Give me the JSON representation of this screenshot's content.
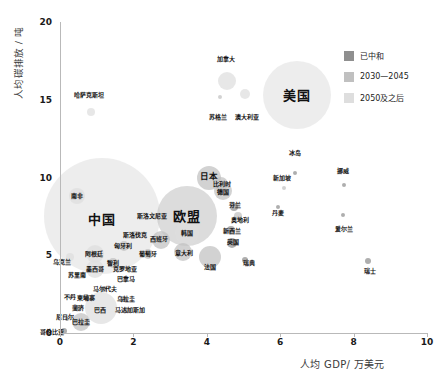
{
  "chart_data": {
    "type": "scatter",
    "title": "",
    "xlabel": "人均 GDP/ 万美元",
    "ylabel": "人均碳排放 / 吨",
    "xlim": [
      0,
      10
    ],
    "ylim": [
      0,
      20
    ],
    "xticks": [
      "0",
      "2",
      "4",
      "6",
      "8",
      "10"
    ],
    "yticks": [
      "0",
      "5",
      "10",
      "15",
      "20"
    ],
    "grid": false,
    "legend_position": "top-right",
    "legend": [
      {
        "label": "已中和",
        "color": "#8f8f8f"
      },
      {
        "label": "2030—2045",
        "color": "#c0c0c0"
      },
      {
        "label": "2050及之后",
        "color": "#dedede"
      }
    ],
    "points": [
      {
        "name": "美国",
        "x": 6.45,
        "y": 15.3,
        "r": 34,
        "group": 2,
        "label_size": "big",
        "lx": 6.45,
        "ly": 15.3
      },
      {
        "name": "加拿大",
        "x": 4.55,
        "y": 16.2,
        "r": 9,
        "group": 2,
        "label_size": "sm",
        "lx": 4.52,
        "ly": 17.6
      },
      {
        "name": "苏格兰",
        "x": 4.35,
        "y": 15.2,
        "r": 2,
        "group": 1,
        "label_size": "sm",
        "lx": 4.3,
        "ly": 13.9
      },
      {
        "name": "澳大利亚",
        "x": 5.05,
        "y": 15.4,
        "r": 5,
        "group": 2,
        "label_size": "sm",
        "lx": 5.1,
        "ly": 13.9
      },
      {
        "name": "哈萨克斯坦",
        "x": 0.85,
        "y": 14.2,
        "r": 4,
        "group": 2,
        "label_size": "sm",
        "lx": 0.8,
        "ly": 15.3
      },
      {
        "name": "中国",
        "x": 1.15,
        "y": 7.5,
        "r": 58,
        "group": 2,
        "label_size": "big",
        "lx": 1.15,
        "ly": 7.3
      },
      {
        "name": "南非",
        "x": 0.45,
        "y": 8.8,
        "r": 8,
        "group": 2,
        "label_size": "sm",
        "lx": 0.45,
        "ly": 8.8
      },
      {
        "name": "欧盟",
        "x": 3.45,
        "y": 7.5,
        "r": 30,
        "group": 1,
        "label_size": "big",
        "lx": 3.45,
        "ly": 7.5
      },
      {
        "name": "日本",
        "x": 4.05,
        "y": 10.0,
        "r": 12,
        "group": 1,
        "label_size": "mid",
        "lx": 4.05,
        "ly": 10.1
      },
      {
        "name": "比利时",
        "x": 4.4,
        "y": 9.6,
        "r": 7,
        "group": 1,
        "label_size": "sm",
        "lx": 4.42,
        "ly": 9.55
      },
      {
        "name": "德国",
        "x": 4.45,
        "y": 9.1,
        "r": 9,
        "group": 1,
        "label_size": "sm",
        "lx": 4.45,
        "ly": 9.05
      },
      {
        "name": "芬兰",
        "x": 4.75,
        "y": 8.1,
        "r": 4,
        "group": 0,
        "label_size": "sm",
        "lx": 4.78,
        "ly": 8.25
      },
      {
        "name": "奥地利",
        "x": 4.85,
        "y": 7.5,
        "r": 4,
        "group": 1,
        "label_size": "sm",
        "lx": 4.9,
        "ly": 7.25
      },
      {
        "name": "冰岛",
        "x": 6.4,
        "y": 10.3,
        "r": 2,
        "group": 0,
        "label_size": "sm",
        "lx": 6.4,
        "ly": 11.6
      },
      {
        "name": "新加坡",
        "x": 6.1,
        "y": 9.3,
        "r": 2,
        "group": 1,
        "label_size": "sm",
        "lx": 6.05,
        "ly": 10.0
      },
      {
        "name": "挪威",
        "x": 7.75,
        "y": 9.5,
        "r": 2,
        "group": 0,
        "label_size": "sm",
        "lx": 7.72,
        "ly": 10.4
      },
      {
        "name": "丹麦",
        "x": 5.95,
        "y": 8.1,
        "r": 2,
        "group": 0,
        "label_size": "sm",
        "lx": 5.95,
        "ly": 7.7
      },
      {
        "name": "爱尔兰",
        "x": 7.7,
        "y": 7.6,
        "r": 2,
        "group": 0,
        "label_size": "sm",
        "lx": 7.75,
        "ly": 6.7
      },
      {
        "name": "新西兰",
        "x": 4.65,
        "y": 6.6,
        "r": 4,
        "group": 0,
        "label_size": "sm",
        "lx": 4.68,
        "ly": 6.55
      },
      {
        "name": "英国",
        "x": 4.7,
        "y": 5.8,
        "r": 5,
        "group": 0,
        "label_size": "sm",
        "lx": 4.72,
        "ly": 5.85
      },
      {
        "name": "韩国",
        "x": 3.45,
        "y": 6.4,
        "r": 12,
        "group": 2,
        "label_size": "sm",
        "lx": 3.45,
        "ly": 6.4
      },
      {
        "name": "意大利",
        "x": 3.35,
        "y": 5.2,
        "r": 9,
        "group": 1,
        "label_size": "sm",
        "lx": 3.38,
        "ly": 5.15
      },
      {
        "name": "法国",
        "x": 4.1,
        "y": 4.9,
        "r": 11,
        "group": 1,
        "label_size": "sm",
        "lx": 4.1,
        "ly": 4.25
      },
      {
        "name": "瑞典",
        "x": 5.05,
        "y": 4.7,
        "r": 3,
        "group": 0,
        "label_size": "sm",
        "lx": 5.15,
        "ly": 4.5
      },
      {
        "name": "瑞士",
        "x": 8.4,
        "y": 4.6,
        "r": 3,
        "group": 0,
        "label_size": "sm",
        "lx": 8.45,
        "ly": 4.0
      },
      {
        "name": "斯洛文尼亚",
        "x": 2.55,
        "y": 7.5,
        "r": 3,
        "group": 1,
        "label_size": "sm",
        "lx": 2.5,
        "ly": 7.5
      },
      {
        "name": "斯洛伐克",
        "x": 2.05,
        "y": 6.3,
        "r": 4,
        "group": 1,
        "label_size": "sm",
        "lx": 2.05,
        "ly": 6.3
      },
      {
        "name": "西班牙",
        "x": 2.75,
        "y": 6.0,
        "r": 9,
        "group": 1,
        "label_size": "sm",
        "lx": 2.7,
        "ly": 6.05
      },
      {
        "name": "匈牙利",
        "x": 1.75,
        "y": 5.6,
        "r": 5,
        "group": 1,
        "label_size": "sm",
        "lx": 1.72,
        "ly": 5.6
      },
      {
        "name": "葡萄牙",
        "x": 2.4,
        "y": 5.1,
        "r": 5,
        "group": 1,
        "label_size": "sm",
        "lx": 2.4,
        "ly": 5.05
      },
      {
        "name": "阿根廷",
        "x": 0.95,
        "y": 5.1,
        "r": 9,
        "group": 2,
        "label_size": "sm",
        "lx": 0.93,
        "ly": 5.1
      },
      {
        "name": "乌克兰",
        "x": 0.28,
        "y": 4.9,
        "r": 4,
        "group": 2,
        "label_size": "sm",
        "lx": 0.05,
        "ly": 4.55
      },
      {
        "name": "智利",
        "x": 1.45,
        "y": 4.5,
        "r": 5,
        "group": 1,
        "label_size": "sm",
        "lx": 1.45,
        "ly": 4.5
      },
      {
        "name": "墨西哥",
        "x": 0.95,
        "y": 4.1,
        "r": 9,
        "group": 2,
        "label_size": "sm",
        "lx": 0.95,
        "ly": 4.1
      },
      {
        "name": "克罗地亚",
        "x": 1.7,
        "y": 4.1,
        "r": 3,
        "group": 1,
        "label_size": "sm",
        "lx": 1.78,
        "ly": 4.1
      },
      {
        "name": "苏里南",
        "x": 0.45,
        "y": 3.7,
        "r": 2,
        "group": 0,
        "label_size": "sm",
        "lx": 0.45,
        "ly": 3.75
      },
      {
        "name": "巴拿马",
        "x": 1.75,
        "y": 3.5,
        "r": 3,
        "group": 1,
        "label_size": "sm",
        "lx": 1.8,
        "ly": 3.5
      },
      {
        "name": "马尔代夫",
        "x": 1.2,
        "y": 2.8,
        "r": 3,
        "group": 0,
        "label_size": "sm",
        "lx": 1.22,
        "ly": 2.8
      },
      {
        "name": "不丹",
        "x": 0.3,
        "y": 2.3,
        "r": 2,
        "group": 0,
        "label_size": "sm",
        "lx": 0.28,
        "ly": 2.3
      },
      {
        "name": "柬埔寨",
        "x": 0.7,
        "y": 2.3,
        "r": 3,
        "group": 0,
        "label_size": "sm",
        "lx": 0.72,
        "ly": 2.25
      },
      {
        "name": "乌拉圭",
        "x": 1.75,
        "y": 2.2,
        "r": 3,
        "group": 0,
        "label_size": "sm",
        "lx": 1.8,
        "ly": 2.2
      },
      {
        "name": "斐济",
        "x": 0.48,
        "y": 1.6,
        "r": 3,
        "group": 0,
        "label_size": "sm",
        "lx": 0.48,
        "ly": 1.6
      },
      {
        "name": "巴西",
        "x": 1.12,
        "y": 1.6,
        "r": 16,
        "group": 2,
        "label_size": "sm",
        "lx": 1.1,
        "ly": 1.5
      },
      {
        "name": "马达加斯加",
        "x": 1.8,
        "y": 1.5,
        "r": 3,
        "group": 0,
        "label_size": "sm",
        "lx": 1.9,
        "ly": 1.5
      },
      {
        "name": "尼日尔",
        "x": 0.18,
        "y": 0.9,
        "r": 2,
        "group": 0,
        "label_size": "sm",
        "lx": 0.13,
        "ly": 1.0
      },
      {
        "name": "巴拉圭",
        "x": 0.58,
        "y": 0.7,
        "r": 9,
        "group": 1,
        "label_size": "sm",
        "lx": 0.58,
        "ly": 0.7
      },
      {
        "name": "哥伦比亚",
        "x": 0.12,
        "y": 0.1,
        "r": 3,
        "group": 0,
        "label_size": "sm",
        "lx": -0.22,
        "ly": 0.08
      }
    ]
  }
}
